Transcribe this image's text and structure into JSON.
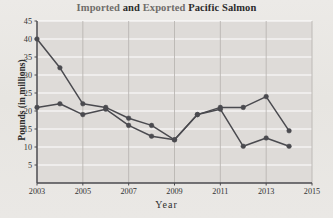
{
  "chart_data": {
    "type": "line",
    "title": "Imported and Exported Pacific Salmon",
    "title_part_1": "Imported ",
    "title_part_2": "and ",
    "title_part_3": "Exported ",
    "title_part_4": "Pacific Salmon",
    "xlabel": "Year",
    "ylabel": "Pounds (in millions)",
    "x": [
      2003,
      2004,
      2005,
      2006,
      2007,
      2008,
      2009,
      2010,
      2011,
      2012,
      2013,
      2014
    ],
    "xlim": [
      2003,
      2015
    ],
    "ylim": [
      0,
      45
    ],
    "xticks": [
      2003,
      2005,
      2007,
      2009,
      2011,
      2013,
      2015
    ],
    "xtick_labels": [
      "2003",
      "2005",
      "2007",
      "2009",
      "2011",
      "2013",
      "2015"
    ],
    "yticks": [
      5,
      10,
      15,
      20,
      25,
      30,
      35,
      40,
      45
    ],
    "ytick_labels": [
      "5",
      "10",
      "15",
      "20",
      "25",
      "30",
      "35",
      "40",
      "45"
    ],
    "grid": "horizontal-white-and-vertical-gray",
    "legend": "none",
    "series": [
      {
        "name": "Imported",
        "color": "#4a4a4f",
        "values": [
          40,
          32,
          22,
          21,
          18,
          16,
          12,
          19,
          21,
          21,
          24,
          14.5
        ]
      },
      {
        "name": "Exported",
        "color": "#4a4a4f",
        "values": [
          21,
          22,
          19,
          20.5,
          16,
          13,
          12,
          19,
          20.5,
          10.2,
          12.5,
          10.2
        ]
      }
    ],
    "plot_bg": "#dedbd8",
    "gridline_color": "#ffffff",
    "vgridline_color": "#b9b6b2",
    "axis_color": "#4a4a4f"
  }
}
